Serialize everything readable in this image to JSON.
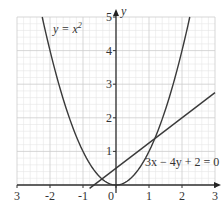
{
  "chart_data": {
    "type": "line",
    "title": "",
    "xlabel": "x",
    "ylabel": "y",
    "xlim": [
      -3,
      3
    ],
    "ylim": [
      0,
      5
    ],
    "grid": true,
    "minor_grid_step": 0.2,
    "major_grid_step": 1,
    "x_ticks": [
      "3",
      "-2",
      "-1",
      "0",
      "1",
      "2",
      "3"
    ],
    "x_tick_values": [
      -3,
      -2,
      -1,
      0,
      1,
      2,
      3
    ],
    "y_ticks": [
      "1",
      "2",
      "3",
      "4",
      "5"
    ],
    "y_tick_values": [
      1,
      2,
      3,
      4,
      5
    ],
    "series": [
      {
        "name": "y = x^2",
        "label_text": "y = x",
        "label_sup": "2",
        "equation": "y = x^2",
        "x_range": [
          -2.236,
          2.236
        ],
        "points": [
          [
            -2.236,
            5
          ],
          [
            -2,
            4
          ],
          [
            -1.5,
            2.25
          ],
          [
            -1,
            1
          ],
          [
            -0.5,
            0.25
          ],
          [
            0,
            0
          ],
          [
            0.5,
            0.25
          ],
          [
            1,
            1
          ],
          [
            1.5,
            2.25
          ],
          [
            2,
            4
          ],
          [
            2.236,
            5
          ]
        ]
      },
      {
        "name": "3x - 4y + 2 = 0",
        "label_text": "3x − 4y + 2 = 0",
        "equation": "y = 0.75x + 0.5",
        "x_range": [
          -0.8,
          3
        ],
        "points": [
          [
            -0.8,
            -0.1
          ],
          [
            -0.667,
            0
          ],
          [
            0,
            0.5
          ],
          [
            1,
            1.25
          ],
          [
            2,
            2
          ],
          [
            3,
            2.75
          ]
        ]
      }
    ],
    "intersections": [
      [
        -0.5,
        0.125
      ],
      [
        1.25,
        1.4375
      ]
    ],
    "axis_labels": {
      "x": "",
      "y": "y"
    },
    "colors": {
      "curve": "#3a3a3a",
      "grid_minor": "#e4e4e4",
      "grid_major": "#cfcfcf",
      "axis": "#333333"
    }
  }
}
